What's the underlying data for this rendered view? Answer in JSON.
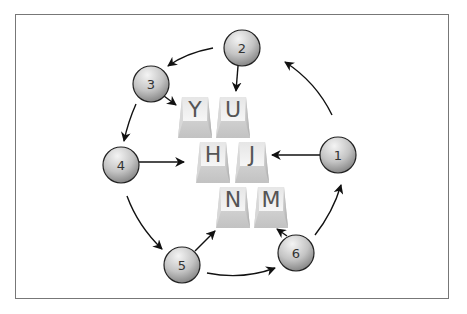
{
  "diagram": {
    "type": "cycle-flow",
    "keys": [
      {
        "id": "Y",
        "label": "Y",
        "x": 178,
        "y": 97
      },
      {
        "id": "U",
        "label": "U",
        "x": 216,
        "y": 97
      },
      {
        "id": "H",
        "label": "H",
        "x": 196,
        "y": 142
      },
      {
        "id": "J",
        "label": "J",
        "x": 235,
        "y": 142
      },
      {
        "id": "N",
        "label": "N",
        "x": 216,
        "y": 187
      },
      {
        "id": "M",
        "label": "M",
        "x": 254,
        "y": 187
      }
    ],
    "nodes": [
      {
        "id": "1",
        "label": "1",
        "cx": 338,
        "cy": 155
      },
      {
        "id": "2",
        "label": "2",
        "cx": 242,
        "cy": 48
      },
      {
        "id": "3",
        "label": "3",
        "cx": 151,
        "cy": 83
      },
      {
        "id": "4",
        "label": "4",
        "cx": 121,
        "cy": 165
      },
      {
        "id": "5",
        "label": "5",
        "cx": 182,
        "cy": 265
      },
      {
        "id": "6",
        "label": "6",
        "cx": 296,
        "cy": 253
      }
    ],
    "edges": [
      {
        "from": "1",
        "to": "J"
      },
      {
        "from": "1",
        "to": "2"
      },
      {
        "from": "2",
        "to": "U"
      },
      {
        "from": "2",
        "to": "3"
      },
      {
        "from": "3",
        "to": "Y"
      },
      {
        "from": "3",
        "to": "4"
      },
      {
        "from": "4",
        "to": "H"
      },
      {
        "from": "4",
        "to": "5"
      },
      {
        "from": "5",
        "to": "N"
      },
      {
        "from": "5",
        "to": "6"
      },
      {
        "from": "6",
        "to": "M"
      },
      {
        "from": "6",
        "to": "1"
      }
    ],
    "colors": {
      "frame": "#777777",
      "arrow": "#111111",
      "node_light": "#eeeeee",
      "node_dark": "#8a8a8a",
      "key_light": "#f2f2f2",
      "key_dark": "#bdbdbd"
    }
  }
}
